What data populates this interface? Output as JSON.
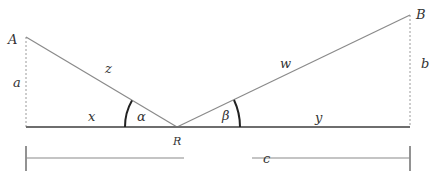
{
  "diagram": {
    "type": "geometry-reflection",
    "colors": {
      "line": "#8a8a8a",
      "baseline": "#6e6e6e",
      "arc": "#222222",
      "text": "#333333",
      "dotted": "#9a9a9a"
    },
    "points": {
      "A": {
        "label": "A",
        "x": 26,
        "y": 37
      },
      "B": {
        "label": "B",
        "x": 410,
        "y": 15
      },
      "R": {
        "label": "R",
        "x": 177,
        "y": 127
      }
    },
    "labels": {
      "A": "A",
      "B": "B",
      "R": "R",
      "a": "a",
      "b": "b",
      "x": "x",
      "y": "y",
      "z": "z",
      "w": "w",
      "c": "c",
      "alpha": "α",
      "beta": "β"
    },
    "segments": [
      {
        "name": "z",
        "from": "A",
        "to": "R"
      },
      {
        "name": "w",
        "from": "R",
        "to": "B"
      },
      {
        "name": "a",
        "from": "A",
        "to": "baseline",
        "style": "dotted"
      },
      {
        "name": "b",
        "from": "B",
        "to": "baseline",
        "style": "dotted"
      },
      {
        "name": "x",
        "from": "A-foot",
        "to": "R"
      },
      {
        "name": "y",
        "from": "R",
        "to": "B-foot"
      },
      {
        "name": "c",
        "span": "A-foot to B-foot",
        "style": "dimension"
      }
    ],
    "angles": [
      {
        "name": "alpha",
        "vertex": "R",
        "between": [
          "z",
          "x"
        ]
      },
      {
        "name": "beta",
        "vertex": "R",
        "between": [
          "w",
          "y"
        ]
      }
    ]
  }
}
